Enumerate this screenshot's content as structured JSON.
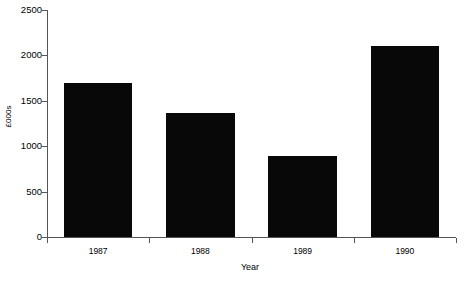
{
  "chart_data": {
    "type": "bar",
    "title": "",
    "categories": [
      "1987",
      "1988",
      "1989",
      "1990"
    ],
    "values": [
      1700,
      1370,
      890,
      2100
    ],
    "series": [
      {
        "name": "Turnover",
        "values": [
          1700,
          1370,
          890,
          2100
        ]
      }
    ],
    "xlabel": "Year",
    "ylabel": "£000s",
    "ylim": [
      0,
      2500
    ],
    "yticks": [
      0,
      500,
      1000,
      1500,
      2000,
      2500
    ],
    "ytick_labels": [
      "0",
      "500",
      "1000",
      "1500",
      "2000",
      "2500"
    ],
    "xtick_labels": [
      "1987",
      "1988",
      "1989",
      "1990"
    ],
    "grid": false,
    "legend": false,
    "bar_color": "#080808",
    "axis_color": "#555555",
    "background_color": "#ffffff"
  },
  "axes": {
    "y_title": "£000s",
    "x_title": "Year"
  }
}
